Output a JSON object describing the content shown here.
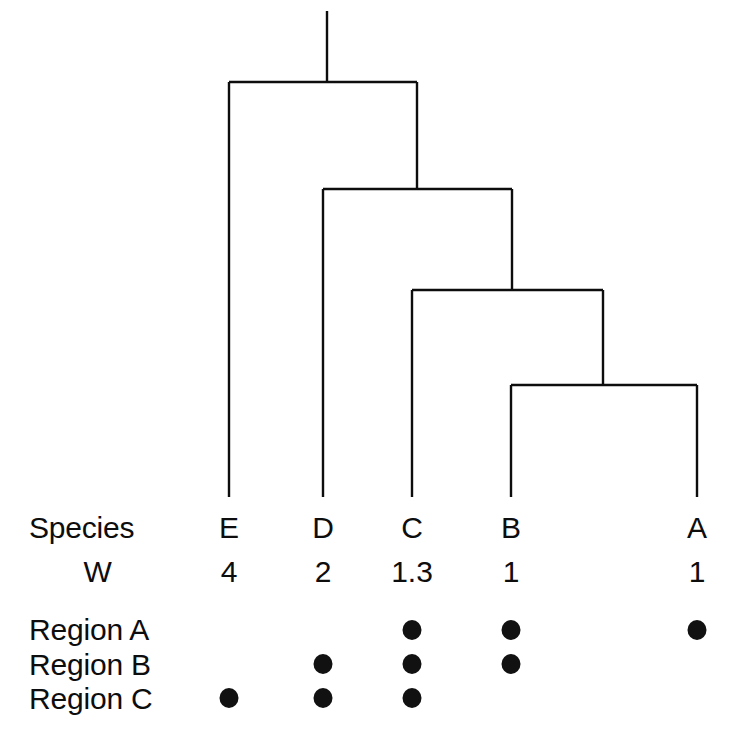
{
  "figure": {
    "background_color": "#ffffff",
    "ink_color": "#0d0d0d"
  },
  "chart_data": {
    "type": "diagram",
    "subtype": "cladogram-with-character-matrix",
    "title": "",
    "xlabel": "",
    "ylabel": "",
    "tree": {
      "orientation": "top-down",
      "topology": "((((A,B),C),D),E)",
      "newick": "(E,(D,(C,(B,A))));",
      "root_stem": {
        "x": 327,
        "y_top": 11,
        "y_bottom": 82
      },
      "tip_order": [
        "E",
        "D",
        "C",
        "B",
        "A"
      ],
      "tip_x": [
        229,
        323,
        412,
        511,
        697
      ],
      "tip_y": 497,
      "nodes": [
        {
          "id": "node1",
          "y": 82,
          "x_left": 229,
          "x_right": 417,
          "left_child": "E",
          "right_child": "node2"
        },
        {
          "id": "node2",
          "y": 189,
          "x_left": 323,
          "x_right": 512,
          "left_child": "D",
          "right_child": "node3"
        },
        {
          "id": "node3",
          "y": 290,
          "x_left": 412,
          "x_right": 603,
          "left_child": "C",
          "right_child": "node4"
        },
        {
          "id": "node4",
          "y": 385,
          "x_left": 511,
          "x_right": 697,
          "left_child": "B",
          "right_child": "A"
        }
      ]
    },
    "columns": [
      "E",
      "D",
      "C",
      "B",
      "A"
    ],
    "column_x": [
      229,
      323,
      412,
      511,
      697
    ],
    "rows": [
      {
        "label": "Species",
        "values": [
          "E",
          "D",
          "C",
          "B",
          "A"
        ]
      },
      {
        "label": "W",
        "values": [
          "4",
          "2",
          "1.3",
          "1",
          "1"
        ]
      },
      {
        "label": "Region A",
        "values": [
          false,
          false,
          true,
          true,
          true
        ]
      },
      {
        "label": "Region B",
        "values": [
          false,
          true,
          true,
          true,
          false
        ]
      },
      {
        "label": "Region C",
        "values": [
          true,
          true,
          true,
          false,
          false
        ]
      }
    ]
  },
  "labels": {
    "species_row": "Species",
    "weight_row": "W",
    "region_a_row": "Region A",
    "region_b_row": "Region B",
    "region_c_row": "Region C"
  },
  "species_row": {
    "e": "E",
    "d": "D",
    "c": "C",
    "b": "B",
    "a": "A"
  },
  "weight_row": {
    "e": "4",
    "d": "2",
    "c": "1.3",
    "b": "1",
    "a": "1"
  }
}
